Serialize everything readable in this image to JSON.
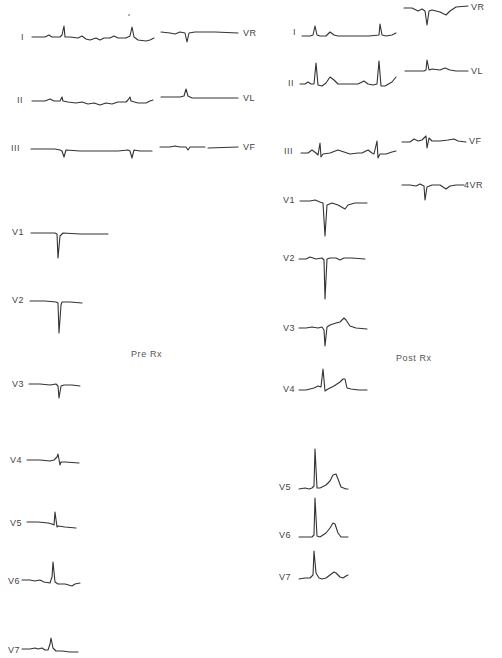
{
  "panels": {
    "pre": {
      "caption": "Pre Rx",
      "limb_leads": {
        "I": "I",
        "II": "II",
        "III": "III",
        "VR": "VR",
        "VL": "VL",
        "VF": "VF"
      },
      "chest_leads": {
        "V1": "V1",
        "V2": "V2",
        "V3": "V3",
        "V4": "V4",
        "V5": "V5",
        "V6": "V6",
        "V7": "V7"
      }
    },
    "post": {
      "caption": "Post Rx",
      "limb_leads": {
        "I": "I",
        "II": "II",
        "III": "III",
        "VR": "VR",
        "VL": "VL",
        "VF": "VF",
        "4VR": "4VR"
      },
      "chest_leads": {
        "V1": "V1",
        "V2": "V2",
        "V3": "V3",
        "V4": "V4",
        "V5": "V5",
        "V6": "V6",
        "V7": "V7"
      }
    }
  }
}
